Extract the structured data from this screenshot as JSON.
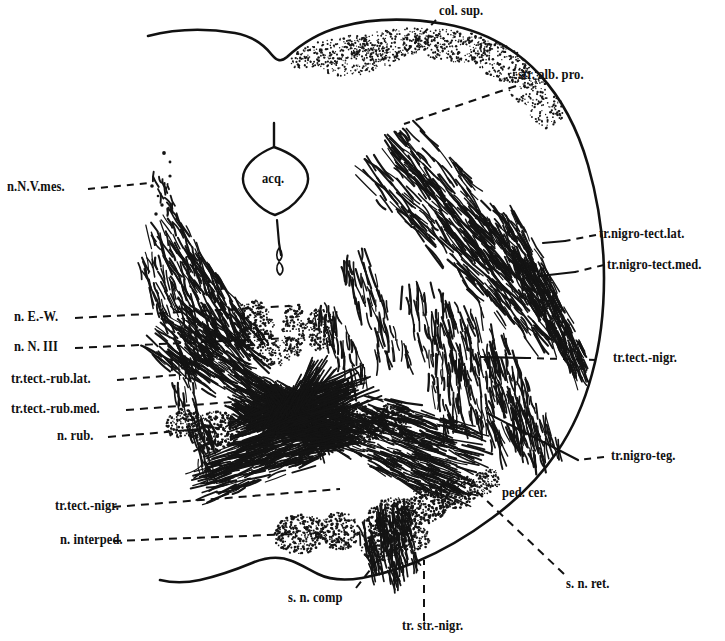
{
  "figure": {
    "type": "anatomical-line-drawing",
    "ink_color": "#111111",
    "background_color": "#ffffff"
  },
  "labels": {
    "col_sup": "col. sup.",
    "str_alb_pro": "str. alb. pro.",
    "n_n_v_mes": "n.N.V.mes.",
    "acq": "acq.",
    "tr_nigro_tect_lat": "tr.nigro-tect.lat.",
    "tr_nigro_tect_med": "tr.nigro-tect.med.",
    "n_e_w": "n. E.-W.",
    "n_n_iii": "n. N. III",
    "tr_tect_rub_lat": "tr.tect.-rub.lat.",
    "tr_tect_rub_med": "tr.tect.-rub.med.",
    "n_rub": "n. rub.",
    "tr_tect_nigr_right": "tr.tect.-nigr.",
    "tr_nigro_teg": "tr.nigro-teg.",
    "ped_cer": "ped. cer.",
    "tr_tect_nigr_left": "tr.tect.-nigr.",
    "n_interped": "n. interped.",
    "s_n_comp": "s. n. comp",
    "s_n_ret": "s. n. ret.",
    "tr_str_nigr": "tr. str.-nigr."
  },
  "structures": [
    {
      "name": "superior-colliculus",
      "label_key": "col_sup"
    },
    {
      "name": "stratum-album-profundum",
      "label_key": "str_alb_pro"
    },
    {
      "name": "mesencephalic-nucleus-trigeminal",
      "label_key": "n_n_v_mes"
    },
    {
      "name": "cerebral-aqueduct",
      "label_key": "acq"
    },
    {
      "name": "nigrotectal-tract-lateral",
      "label_key": "tr_nigro_tect_lat"
    },
    {
      "name": "nigrotectal-tract-medial",
      "label_key": "tr_nigro_tect_med"
    },
    {
      "name": "edinger-westphal-nucleus",
      "label_key": "n_e_w"
    },
    {
      "name": "oculomotor-nucleus",
      "label_key": "n_n_iii"
    },
    {
      "name": "tectorubral-tract-lateral",
      "label_key": "tr_tect_rub_lat"
    },
    {
      "name": "tectorubral-tract-medial",
      "label_key": "tr_tect_rub_med"
    },
    {
      "name": "red-nucleus",
      "label_key": "n_rub"
    },
    {
      "name": "tectonigral-tract",
      "label_key": "tr_tect_nigr_right"
    },
    {
      "name": "nigrotegmental-tract",
      "label_key": "tr_nigro_teg"
    },
    {
      "name": "cerebral-peduncle",
      "label_key": "ped_cer"
    },
    {
      "name": "interpeduncular-nucleus",
      "label_key": "n_interped"
    },
    {
      "name": "substantia-nigra-pars-compacta",
      "label_key": "s_n_comp"
    },
    {
      "name": "substantia-nigra-pars-reticulata",
      "label_key": "s_n_ret"
    },
    {
      "name": "striatonigral-tract",
      "label_key": "tr_str_nigr"
    }
  ]
}
